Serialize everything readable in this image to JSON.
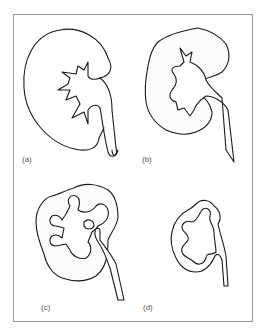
{
  "figure": {
    "panels": [
      {
        "id": "a",
        "label": "(a)",
        "description": "Normal kidney with smooth outline, renal pelvis and ureter"
      },
      {
        "id": "b",
        "label": "(b)",
        "description": "Kidney with irregular outline and stippled (scarred) cortex"
      },
      {
        "id": "c",
        "label": "(c)",
        "description": "Kidney with dilated, clubbed calyces and thinned stippled cortex"
      },
      {
        "id": "d",
        "label": "(d)",
        "description": "Small contracted kidney with lobulated outline"
      }
    ]
  }
}
